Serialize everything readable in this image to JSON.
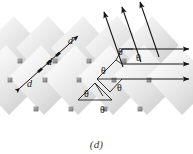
{
  "figure": {
    "caption": "(d)",
    "colors": {
      "plane_light": "#fbfbfb",
      "plane_mid": "#e2e2e2",
      "plane_dark": "#b9b9b9",
      "atom": "#8d8d8d",
      "atom_dark": "#6f6f6f",
      "ray": "#1a1a1a",
      "label": "#1a1a1a",
      "background": "#ffffff"
    }
  },
  "labels": {
    "spacing": "d",
    "angle": "θ"
  },
  "spacing_labels": [
    {
      "text": "d",
      "x": 27,
      "y": 84
    },
    {
      "text": "d",
      "x": 47,
      "y": 62
    },
    {
      "text": "d",
      "x": 68,
      "y": 41
    }
  ],
  "angle_labels": [
    {
      "text": "θ",
      "x": 105,
      "y": 70
    },
    {
      "text": "θ",
      "x": 122,
      "y": 51
    },
    {
      "text": "θ",
      "x": 140,
      "y": 57
    },
    {
      "text": "θ",
      "x": 121,
      "y": 87
    },
    {
      "text": "θ",
      "x": 88,
      "y": 93
    },
    {
      "text": "θ",
      "x": 104,
      "y": 109
    }
  ],
  "atoms": [
    {
      "x": 20,
      "y": 61
    },
    {
      "x": 55,
      "y": 61
    },
    {
      "x": 89,
      "y": 61
    },
    {
      "x": 124,
      "y": 61
    },
    {
      "x": 10,
      "y": 80
    },
    {
      "x": 45,
      "y": 80
    },
    {
      "x": 79,
      "y": 80
    },
    {
      "x": 114,
      "y": 80
    },
    {
      "x": 149,
      "y": 80
    },
    {
      "x": 36,
      "y": 109
    },
    {
      "x": 71,
      "y": 109
    },
    {
      "x": 105,
      "y": 109
    },
    {
      "x": 140,
      "y": 109
    }
  ],
  "planes": [
    {
      "id": "plane-1"
    },
    {
      "id": "plane-2"
    },
    {
      "id": "plane-3"
    },
    {
      "id": "plane-4"
    },
    {
      "id": "plane-5"
    },
    {
      "id": "plane-6"
    },
    {
      "id": "plane-7"
    },
    {
      "id": "plane-8"
    }
  ],
  "incident_rays": [
    {
      "id": "incident-ray-1"
    },
    {
      "id": "incident-ray-2"
    },
    {
      "id": "incident-ray-3"
    }
  ],
  "outgoing_rays": [
    {
      "id": "outgoing-ray-1"
    },
    {
      "id": "outgoing-ray-2"
    },
    {
      "id": "outgoing-ray-3"
    }
  ],
  "spacing_arrow": {
    "id": "interplanar-spacing-arrow"
  }
}
